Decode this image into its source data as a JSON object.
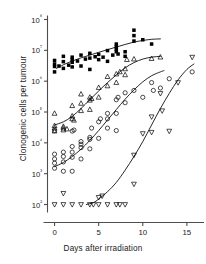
{
  "chart_data": {
    "type": "scatter",
    "title": "",
    "xlabel": "Days after irradiation",
    "ylabel": "Clonogenic cells per tumour",
    "yscale": "log",
    "xlim": [
      -0.8,
      16.6
    ],
    "ylim": [
      60,
      200000000
    ],
    "xticks": [
      0,
      5,
      10,
      15
    ],
    "xticklabels": [
      "0",
      "5",
      "10",
      "15"
    ],
    "yticks": [
      100,
      1000,
      10000,
      100000,
      1000000,
      10000000,
      100000000
    ],
    "yticklabels": [
      "10²",
      "10³",
      "10⁴",
      "10⁵",
      "10⁶",
      "10⁷",
      "10⁸"
    ],
    "grid": false,
    "legend": "none",
    "series": [
      {
        "name": "filled-square-series",
        "marker": "filled-square",
        "color": "#000000",
        "points": [
          [
            0,
            2000000
          ],
          [
            0,
            3000000
          ],
          [
            0,
            3600000
          ],
          [
            0,
            4700000
          ],
          [
            0.5,
            3100000
          ],
          [
            1,
            2600000
          ],
          [
            1,
            4300000
          ],
          [
            1,
            6400000
          ],
          [
            1.6,
            3300000
          ],
          [
            2,
            2900000
          ],
          [
            2,
            4100000
          ],
          [
            2,
            5000000
          ],
          [
            2,
            6000000
          ],
          [
            2.6,
            4500000
          ],
          [
            3,
            3100000
          ],
          [
            3,
            7000000
          ],
          [
            3.5,
            5200000
          ],
          [
            4,
            2400000
          ],
          [
            4,
            5600000
          ],
          [
            4,
            8000000
          ],
          [
            4.6,
            6200000
          ],
          [
            5,
            5000000
          ],
          [
            5,
            7400000
          ],
          [
            5.5,
            6000000
          ],
          [
            6,
            4400000
          ],
          [
            6,
            9800000
          ],
          [
            6.6,
            7000000
          ],
          [
            7,
            9000000
          ],
          [
            7,
            11000000
          ],
          [
            7,
            13000000
          ],
          [
            7,
            16000000
          ],
          [
            7.2,
            7600000
          ],
          [
            8,
            6400000
          ],
          [
            8,
            9000000
          ],
          [
            9,
            30000000
          ],
          [
            9,
            45000000
          ],
          [
            9,
            20000000
          ],
          [
            10,
            22000000
          ],
          [
            11,
            16000000
          ]
        ],
        "fit_curve": [
          [
            0.2,
            2600000
          ],
          [
            1,
            3400000
          ],
          [
            2,
            4500000
          ],
          [
            3,
            5700000
          ],
          [
            4,
            7000000
          ],
          [
            5,
            8600000
          ],
          [
            6,
            10500000
          ],
          [
            7,
            12800000
          ],
          [
            8,
            15500000
          ],
          [
            9,
            18500000
          ],
          [
            10,
            21000000
          ],
          [
            11,
            22800000
          ],
          [
            12,
            23500000
          ]
        ]
      },
      {
        "name": "open-triangle-series",
        "marker": "open-triangle-up",
        "color": "#000000",
        "points": [
          [
            0,
            24000
          ],
          [
            0,
            30000
          ],
          [
            0,
            36000
          ],
          [
            0,
            90000
          ],
          [
            1,
            26000
          ],
          [
            1,
            30000
          ],
          [
            1,
            34000
          ],
          [
            1.4,
            28000
          ],
          [
            2,
            60000
          ],
          [
            2,
            74000
          ],
          [
            2,
            160000
          ],
          [
            2.2,
            54000
          ],
          [
            3,
            110000
          ],
          [
            3,
            190000
          ],
          [
            3,
            380000
          ],
          [
            4,
            120000
          ],
          [
            4,
            240000
          ],
          [
            4,
            300000
          ],
          [
            4.2,
            270000
          ],
          [
            5,
            300000
          ],
          [
            5,
            620000
          ],
          [
            6,
            700000
          ],
          [
            6,
            1400000
          ],
          [
            7,
            900000
          ],
          [
            7,
            1700000
          ],
          [
            7.4,
            2000000
          ],
          [
            8,
            1600000
          ],
          [
            8,
            2500000
          ],
          [
            8.2,
            5000000
          ],
          [
            9,
            5200000
          ],
          [
            11,
            5400000
          ],
          [
            12,
            6000000
          ]
        ],
        "fit_curve": [
          [
            0,
            38000
          ],
          [
            1,
            48000
          ],
          [
            2,
            72000
          ],
          [
            3,
            130000
          ],
          [
            4,
            250000
          ],
          [
            5,
            480000
          ],
          [
            6,
            900000
          ],
          [
            7,
            1600000
          ],
          [
            8,
            2700000
          ],
          [
            9,
            4000000
          ],
          [
            10,
            5200000
          ],
          [
            11,
            6000000
          ],
          [
            12,
            6400000
          ]
        ]
      },
      {
        "name": "open-circle-series",
        "marker": "open-circle",
        "color": "#000000",
        "points": [
          [
            0,
            1500
          ],
          [
            0,
            2200
          ],
          [
            0,
            3000
          ],
          [
            0,
            4300
          ],
          [
            0,
            25000
          ],
          [
            1,
            1200
          ],
          [
            1,
            2400
          ],
          [
            1,
            3600
          ],
          [
            1,
            5000
          ],
          [
            2,
            1200
          ],
          [
            2,
            3400
          ],
          [
            2,
            5000
          ],
          [
            2,
            7600
          ],
          [
            2,
            24000
          ],
          [
            2.2,
            26000
          ],
          [
            3,
            3000
          ],
          [
            3,
            7000
          ],
          [
            3,
            9000
          ],
          [
            3,
            11000
          ],
          [
            4,
            6400
          ],
          [
            4,
            13000
          ],
          [
            4,
            15000
          ],
          [
            4.2,
            30000
          ],
          [
            5,
            14000
          ],
          [
            5,
            48000
          ],
          [
            5.2,
            60000
          ],
          [
            6,
            30000
          ],
          [
            6,
            60000
          ],
          [
            6,
            90000
          ],
          [
            7,
            25000
          ],
          [
            7,
            90000
          ],
          [
            7,
            250000
          ],
          [
            7.2,
            300000
          ],
          [
            8,
            200000
          ],
          [
            8,
            420000
          ],
          [
            9,
            500000
          ],
          [
            10,
            300000
          ],
          [
            11,
            900000
          ],
          [
            11.2,
            500000
          ],
          [
            12,
            600000
          ],
          [
            13,
            1200000
          ],
          [
            15.6,
            2000000
          ]
        ],
        "fit_curve": [
          [
            0,
            1700
          ],
          [
            1,
            2300
          ],
          [
            2,
            3600
          ],
          [
            3,
            6200
          ],
          [
            4,
            12000
          ],
          [
            5,
            25000
          ],
          [
            6,
            55000
          ],
          [
            7,
            120000
          ],
          [
            8,
            260000
          ],
          [
            9,
            520000
          ],
          [
            10,
            950000
          ],
          [
            11,
            1500000
          ],
          [
            12,
            2000000
          ],
          [
            12.4,
            2200000
          ]
        ]
      },
      {
        "name": "open-inverted-triangle-series",
        "marker": "open-triangle-down",
        "color": "#000000",
        "points": [
          [
            0,
            100
          ],
          [
            1,
            100
          ],
          [
            1,
            230
          ],
          [
            2,
            100
          ],
          [
            3,
            100
          ],
          [
            4,
            100
          ],
          [
            4.4,
            100
          ],
          [
            5,
            100
          ],
          [
            5,
            170
          ],
          [
            5.4,
            190
          ],
          [
            6,
            100
          ],
          [
            7,
            100
          ],
          [
            7.4,
            100
          ],
          [
            8,
            100
          ],
          [
            9,
            460
          ],
          [
            9,
            4000
          ],
          [
            10,
            20000
          ],
          [
            11,
            22000
          ],
          [
            11,
            70000
          ],
          [
            12,
            400000
          ],
          [
            12.2,
            110000
          ],
          [
            13,
            24000
          ],
          [
            14,
            900000
          ],
          [
            15.6,
            6000000
          ]
        ],
        "fit_curve": [
          [
            3.6,
            100
          ],
          [
            4.4,
            115
          ],
          [
            5,
            150
          ],
          [
            6,
            260
          ],
          [
            7,
            520
          ],
          [
            8,
            1300
          ],
          [
            9,
            3600
          ],
          [
            10,
            11000
          ],
          [
            11,
            38000
          ],
          [
            12,
            130000
          ],
          [
            13,
            400000
          ],
          [
            14,
            1100000
          ],
          [
            15,
            2400000
          ],
          [
            15.8,
            3600000
          ]
        ]
      }
    ]
  },
  "axis": {
    "xlabel": "Days after irradiation",
    "ylabel": "Clonogenic cells per tumour"
  }
}
